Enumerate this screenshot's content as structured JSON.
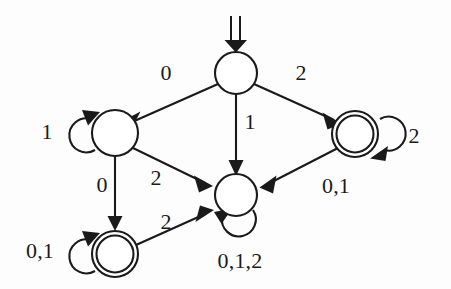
{
  "figure": {
    "type": "finite-state-automaton-diagram",
    "alphabet": [
      "0",
      "1",
      "2"
    ],
    "background_color": "#fdfdfd",
    "ink_color": "#1a1a1a"
  },
  "states": [
    {
      "id": "q-start",
      "name": "start-state",
      "accepting": false,
      "cx": 236,
      "cy": 73,
      "r": 21,
      "is_start": true
    },
    {
      "id": "q-left",
      "name": "left-state",
      "accepting": false,
      "cx": 115,
      "cy": 133,
      "r": 23,
      "is_start": false
    },
    {
      "id": "q-right",
      "name": "right-accepting-state",
      "accepting": true,
      "cx": 355,
      "cy": 134,
      "r": 23,
      "is_start": false
    },
    {
      "id": "q-center",
      "name": "center-sink-state",
      "accepting": false,
      "cx": 236,
      "cy": 195,
      "r": 21,
      "is_start": false
    },
    {
      "id": "q-bottomleft",
      "name": "bottom-accepting-state",
      "accepting": true,
      "cx": 115,
      "cy": 254,
      "r": 23,
      "is_start": false
    }
  ],
  "start_marker": {
    "name": "start-arrow",
    "style": "double-line-down-arrow",
    "x": 236,
    "y_top": 16,
    "y_bottom": 50
  },
  "transitions": [
    {
      "id": "t1",
      "from": "q-start",
      "to": "q-left",
      "label": "0",
      "label_x": 166,
      "label_y": 73,
      "kind": "edge"
    },
    {
      "id": "t2",
      "from": "q-start",
      "to": "q-right",
      "label": "2",
      "label_x": 301,
      "label_y": 73,
      "kind": "edge"
    },
    {
      "id": "t3",
      "from": "q-start",
      "to": "q-center",
      "label": "1",
      "label_x": 250,
      "label_y": 122,
      "kind": "edge"
    },
    {
      "id": "t4",
      "from": "q-left",
      "to": "q-left",
      "label": "1",
      "label_x": 47,
      "label_y": 132,
      "kind": "self-loop"
    },
    {
      "id": "t5",
      "from": "q-left",
      "to": "q-bottomleft",
      "label": "0",
      "label_x": 102,
      "label_y": 185,
      "kind": "edge"
    },
    {
      "id": "t6",
      "from": "q-left",
      "to": "q-center",
      "label": "2",
      "label_x": 156,
      "label_y": 178,
      "kind": "edge"
    },
    {
      "id": "t7",
      "from": "q-right",
      "to": "q-right",
      "label": "2",
      "label_x": 414,
      "label_y": 136,
      "kind": "self-loop"
    },
    {
      "id": "t8",
      "from": "q-right",
      "to": "q-center",
      "label": "0,1",
      "label_x": 336,
      "label_y": 186,
      "kind": "edge"
    },
    {
      "id": "t9",
      "from": "q-bottomleft",
      "to": "q-bottomleft",
      "label": "0,1",
      "label_x": 40,
      "label_y": 251,
      "kind": "self-loop"
    },
    {
      "id": "t10",
      "from": "q-bottomleft",
      "to": "q-center",
      "label": "2",
      "label_x": 166,
      "label_y": 222,
      "kind": "edge"
    },
    {
      "id": "t11",
      "from": "q-center",
      "to": "q-center",
      "label": "0,1,2",
      "label_x": 240,
      "label_y": 261,
      "kind": "self-loop"
    }
  ]
}
